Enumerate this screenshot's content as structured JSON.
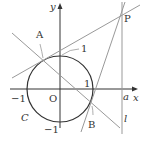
{
  "diagram": {
    "labels": {
      "y_axis": "y",
      "x_axis": "x",
      "origin": "O",
      "point_A": "A",
      "point_P": "P",
      "point_B": "B",
      "circle": "C",
      "line": "l",
      "a": "a",
      "one_top": "1",
      "one_right": "1",
      "neg_one_left": "−1",
      "neg_one_bottom": "−1"
    },
    "colors": {
      "axis": "#333333",
      "circle": "#333333",
      "lines": "#999999"
    }
  }
}
